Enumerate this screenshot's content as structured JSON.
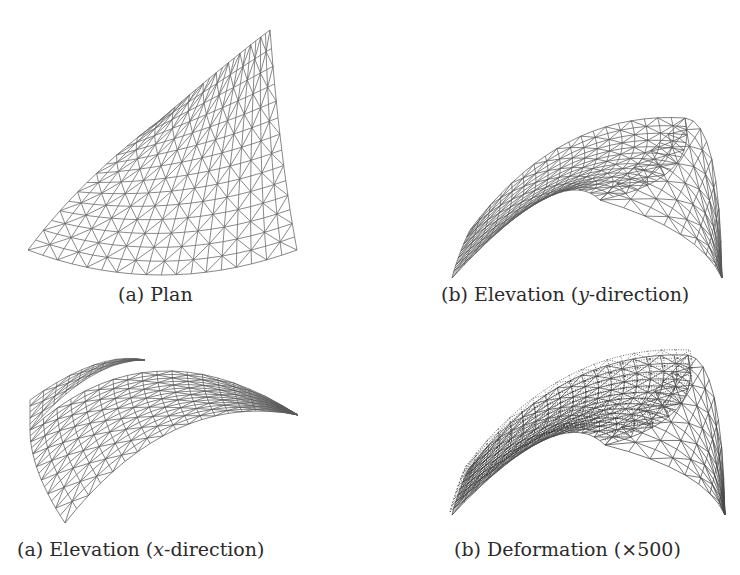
{
  "figure": {
    "top_fragment": "                              ",
    "panels": [
      {
        "id": "plan",
        "caption_prefix": "(a) Plan",
        "caption_italic": "",
        "caption_suffix": "",
        "view": "plan",
        "corners": {
          "top": [
            270,
            30
          ],
          "left": [
            28,
            250
          ],
          "bottomRight": [
            297,
            250
          ],
          "rightMid": [
            286,
            185
          ]
        },
        "stroke": "#6a6a6a",
        "rows": 14,
        "cols": 18
      },
      {
        "id": "elev-y",
        "caption_prefix": "(b) Elevation (",
        "caption_italic": "y",
        "caption_suffix": "-direction)",
        "view": "elevation-y",
        "stroke": "#5a5a5a",
        "rows": 14,
        "cols": 18
      },
      {
        "id": "elev-x",
        "caption_prefix": "(a) Elevation (",
        "caption_italic": "x",
        "caption_suffix": "-direction)",
        "view": "elevation-x",
        "stroke": "#5a5a5a",
        "rows": 14,
        "cols": 18
      },
      {
        "id": "deformation",
        "caption_prefix": "(b) Deformation (×500)",
        "caption_italic": "",
        "caption_suffix": "",
        "view": "deformation",
        "stroke": "#4a4a4a",
        "rows": 14,
        "cols": 18
      }
    ]
  }
}
